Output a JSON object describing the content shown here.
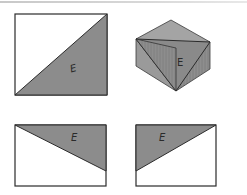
{
  "figure": {
    "colors": {
      "shade": "#8a8a8a",
      "shade_light": "#a6a6a6",
      "shade_dark": "#7a7a7a",
      "outline": "#2b2b2b",
      "background": "#ffffff"
    },
    "panels": [
      {
        "id": "front-view",
        "label": "E"
      },
      {
        "id": "isometric-view",
        "label": "E"
      },
      {
        "id": "top-view",
        "label": "E"
      },
      {
        "id": "side-view",
        "label": "E"
      }
    ]
  }
}
